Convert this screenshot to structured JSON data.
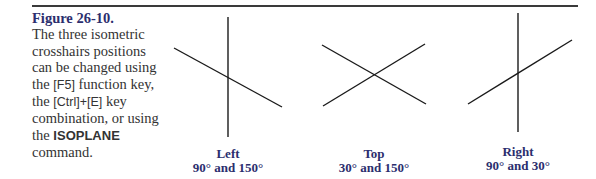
{
  "figure": {
    "number": "Figure 26-10.",
    "caption_parts": {
      "p1": "The three isometric crosshairs positions can be changed using the ",
      "key1": "[F5]",
      "p2": " function key, the ",
      "key2": "[Ctrl]+[E]",
      "p3": " key combination, or using the ",
      "command": "ISOPLANE",
      "p4": " command."
    }
  },
  "crosshairs": [
    {
      "name": "Left",
      "angles": "90° and 150°"
    },
    {
      "name": "Top",
      "angles": "30° and 150°"
    },
    {
      "name": "Right",
      "angles": "90° and 30°"
    }
  ],
  "colors": {
    "label": "#2b2e6e",
    "text": "#333333",
    "line": "#1a1a1a"
  }
}
